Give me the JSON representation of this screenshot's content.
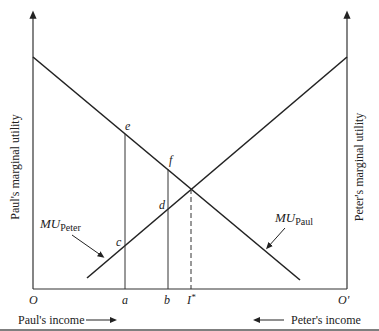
{
  "diagram": {
    "left_axis_label": "Paul's marginal utility",
    "right_axis_label": "Peter's marginal utility",
    "origin_left": "O",
    "origin_right": "O'",
    "x_ticks": [
      "a",
      "b",
      "I"
    ],
    "i_star_superscript": "*",
    "points": [
      "e",
      "f",
      "d",
      "c"
    ],
    "curve_peter": {
      "main": "MU",
      "sub": "Peter"
    },
    "curve_paul": {
      "main": "MU",
      "sub": "Paul"
    },
    "bottom_left_caption": "Paul's income",
    "bottom_right_caption": "Peter's income",
    "colors": {
      "line": "#222222",
      "background": "#ffffff"
    }
  }
}
